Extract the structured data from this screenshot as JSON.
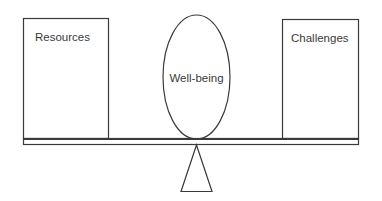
{
  "diagram": {
    "type": "balance-scale",
    "left_box": {
      "label": "Resources"
    },
    "center": {
      "label": "Well-being"
    },
    "right_box": {
      "label": "Challenges"
    },
    "colors": {
      "stroke": "#3a3a3a",
      "background": "#ffffff"
    }
  }
}
